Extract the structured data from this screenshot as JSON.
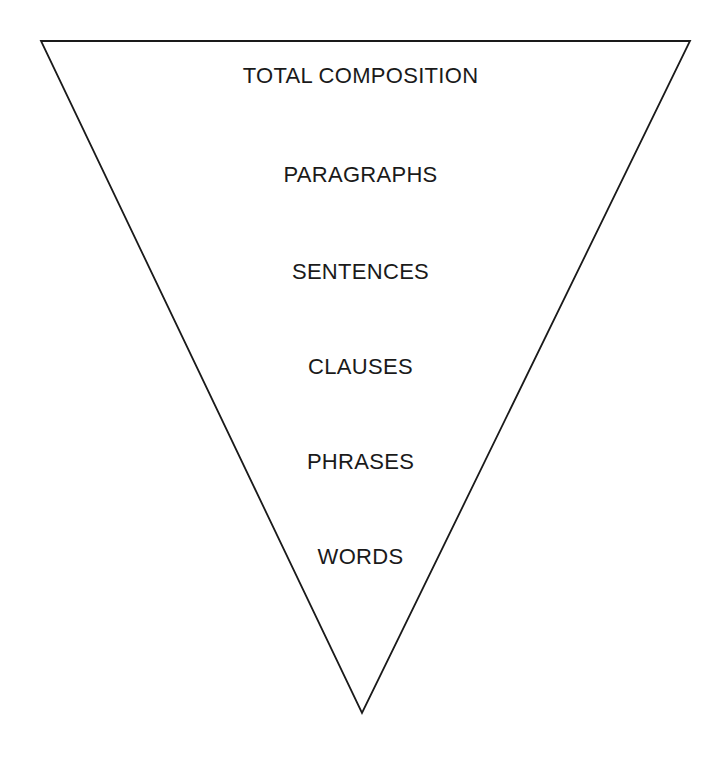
{
  "diagram": {
    "type": "inverted-triangle-hierarchy",
    "levels": [
      {
        "label": "TOTAL COMPOSITION"
      },
      {
        "label": "PARAGRAPHS"
      },
      {
        "label": "SENTENCES"
      },
      {
        "label": "CLAUSES"
      },
      {
        "label": "PHRASES"
      },
      {
        "label": "WORDS"
      }
    ],
    "colors": {
      "stroke": "#1a1a1a",
      "background": "#ffffff",
      "text": "#1a1a1a"
    }
  }
}
